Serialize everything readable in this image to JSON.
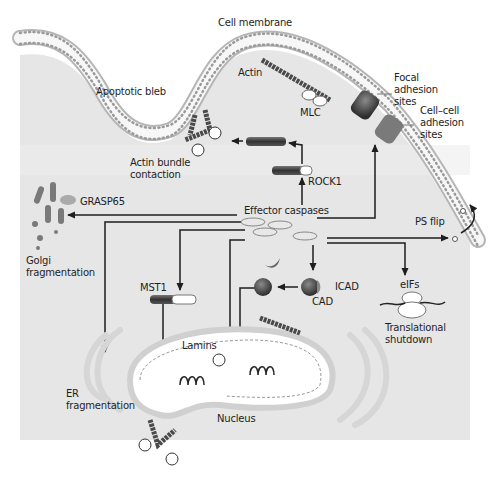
{
  "diagram": {
    "type": "apoptosis-caspase-substrates",
    "labels": {
      "cell_membrane": "Cell membrane",
      "apoptotic_bleb": "Apoptotic bleb",
      "actin": "Actin",
      "mlc": "MLC",
      "focal_adhesion": "Focal\nadhesion\nsites",
      "cell_cell_adhesion": "Cell–cell\nadhesion\nsites",
      "actin_bundle": "Actin bundle\ncontaction",
      "rock1": "ROCK1",
      "grasp65": "GRASP65",
      "effector_caspases": "Effector caspases",
      "ps_flip": "PS flip",
      "golgi_fragmentation": "Golgi\nfragmentation",
      "mst1": "MST1",
      "icad": "ICAD",
      "cad": "CAD",
      "eifs": "eIFs",
      "translational_shutdown": "Translational\nshutdown",
      "lamins": "Lamins",
      "er_fragmentation": "ER\nfragmentation",
      "nucleus": "Nucleus",
      "phospho": "P"
    },
    "colors": {
      "cytoplasm": "#e6e6e6",
      "membrane_bead": "#f4f4f4",
      "membrane_outline": "#9a9a9a",
      "dark_protein": "#4a4a4a",
      "arrow": "#1e1e1e",
      "organelle": "#d2d2d2"
    }
  }
}
